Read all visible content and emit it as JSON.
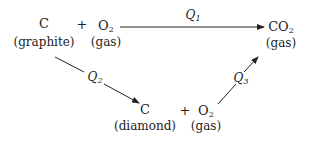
{
  "diagram": {
    "type": "thermochemical cycle (Hess's law)",
    "nodes": {
      "graphite": {
        "species": "C",
        "state": "(graphite)"
      },
      "o2_top": {
        "species": "O",
        "sub": "2",
        "state": "(gas)"
      },
      "co2": {
        "species": "CO",
        "sub": "2",
        "state": "(gas)"
      },
      "diamond": {
        "species": "C",
        "state": "(diamond)"
      },
      "o2_bottom": {
        "species": "O",
        "sub": "2",
        "state": "(gas)"
      }
    },
    "plus": "+",
    "edges": [
      {
        "from": "C(graphite) + O2(gas)",
        "to": "CO2(gas)",
        "label": "Q",
        "sub": "1"
      },
      {
        "from": "C(graphite)",
        "to": "C(diamond)",
        "label": "Q",
        "sub": "2"
      },
      {
        "from": "C(diamond) + O2(gas)",
        "to": "CO2(gas)",
        "label": "Q",
        "sub": "3"
      }
    ]
  }
}
